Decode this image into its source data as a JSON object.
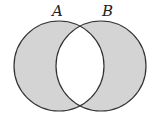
{
  "diagram": {
    "type": "venn",
    "shaded_region": "symmetric difference (A xor B)",
    "sets": [
      {
        "id": "A",
        "label": "A",
        "cx": 59,
        "cy": 66,
        "r": 45,
        "label_x": 52,
        "label_y": 16
      },
      {
        "id": "B",
        "label": "B",
        "cx": 101,
        "cy": 66,
        "r": 45,
        "label_x": 102,
        "label_y": 16
      }
    ],
    "colors": {
      "fill": "#d4d4d4",
      "stroke": "#333333",
      "background": "#ffffff"
    }
  }
}
